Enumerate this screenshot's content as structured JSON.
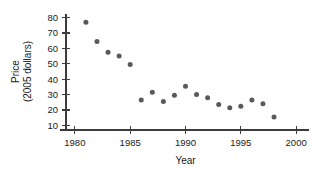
{
  "chart_data": {
    "type": "scatter",
    "title": "",
    "subtitle": "",
    "xlabel": "Year",
    "ylabel": "Price\n(2005 dollars)",
    "ylabel_line1": "Price",
    "ylabel_line2": "(2005 dollars)",
    "xlim": [
      1979.2,
      2000.8
    ],
    "ylim": [
      7,
      83
    ],
    "grid": false,
    "legend": false,
    "legend_position": "none",
    "marker_color": "#595959",
    "axis_color": "#3c3c3c",
    "background_color": "#ffffff",
    "xticks": [
      1980,
      1985,
      1990,
      1995,
      2000
    ],
    "xtick_labels": [
      "1980",
      "1985",
      "1990",
      "1995",
      "2000"
    ],
    "yticks": [
      10,
      20,
      30,
      40,
      50,
      60,
      70,
      80
    ],
    "ytick_labels": [
      "10",
      "20",
      "30",
      "40",
      "50",
      "60",
      "70",
      "80"
    ],
    "x": [
      1981,
      1982,
      1983,
      1984,
      1985,
      1986,
      1987,
      1988,
      1989,
      1990,
      1991,
      1992,
      1993,
      1994,
      1995,
      1996,
      1997,
      1998
    ],
    "values": [
      77.0,
      64.5,
      57.5,
      55.0,
      49.5,
      26.5,
      31.5,
      25.5,
      29.5,
      35.5,
      30.0,
      28.0,
      23.5,
      21.5,
      22.5,
      26.5,
      24.0,
      15.5
    ],
    "points": [
      {
        "year": 1981,
        "price": 77.0
      },
      {
        "year": 1982,
        "price": 64.5
      },
      {
        "year": 1983,
        "price": 57.5
      },
      {
        "year": 1984,
        "price": 55.0
      },
      {
        "year": 1985,
        "price": 49.5
      },
      {
        "year": 1986,
        "price": 26.5
      },
      {
        "year": 1987,
        "price": 31.5
      },
      {
        "year": 1988,
        "price": 25.5
      },
      {
        "year": 1989,
        "price": 29.5
      },
      {
        "year": 1990,
        "price": 35.5
      },
      {
        "year": 1991,
        "price": 30.0
      },
      {
        "year": 1992,
        "price": 28.0
      },
      {
        "year": 1993,
        "price": 23.5
      },
      {
        "year": 1994,
        "price": 21.5
      },
      {
        "year": 1995,
        "price": 22.5
      },
      {
        "year": 1996,
        "price": 26.5
      },
      {
        "year": 1997,
        "price": 24.0
      },
      {
        "year": 1998,
        "price": 15.5
      }
    ]
  }
}
